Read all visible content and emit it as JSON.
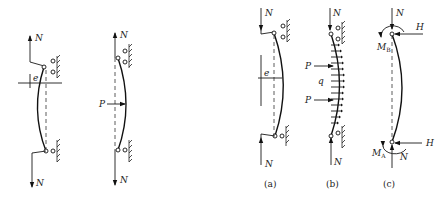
{
  "figure": {
    "panels": [
      {
        "id": "eccentric-load",
        "labels": {
          "top_force": "N",
          "bottom_force": "N",
          "eccentricity": "e"
        }
      },
      {
        "id": "lateral-point-load",
        "labels": {
          "top_force": "N",
          "bottom_force": "N",
          "lateral_load": "P"
        }
      },
      {
        "id": "a",
        "caption": "(a)",
        "labels": {
          "top_force": "N",
          "bottom_force": "N",
          "eccentricity": "e"
        }
      },
      {
        "id": "b",
        "caption": "(b)",
        "labels": {
          "top_force": "N",
          "bottom_force": "N",
          "lateral_load_1": "P",
          "distributed_load": "q",
          "lateral_load_2": "P"
        }
      },
      {
        "id": "c",
        "caption": "(c)",
        "labels": {
          "top_force": "N",
          "top_moment": "M",
          "top_moment_sub": "B",
          "top_shear": "H",
          "bottom_moment": "M",
          "bottom_moment_sub": "A",
          "bottom_force": "N",
          "bottom_shear": "H"
        }
      }
    ]
  }
}
